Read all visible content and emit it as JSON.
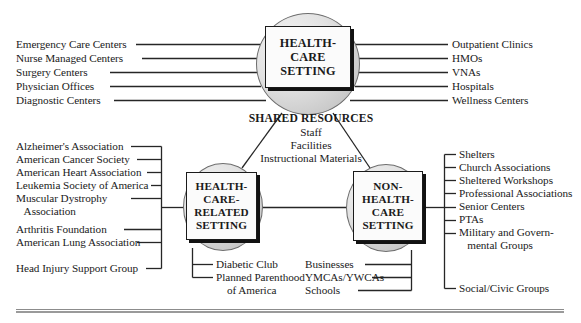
{
  "diagram": {
    "nodes": {
      "health_care_setting": "HEALTH-\nCARE\nSETTING",
      "health_care_related_setting": "HEALTH-\nCARE-\nRELATED\nSETTING",
      "non_health_care_setting": "NON-\nHEALTH-\nCARE\nSETTING"
    },
    "shared_resources": {
      "title": "SHARED RESOURCES",
      "items": [
        "Staff",
        "Facilities",
        "Instructional Materials"
      ]
    },
    "health_care_left": [
      "Emergency Care Centers",
      "Nurse Managed Centers",
      "Surgery Centers",
      "Physician Offices",
      "Diagnostic Centers"
    ],
    "health_care_right": [
      "Outpatient Clinics",
      "HMOs",
      "VNAs",
      "Hospitals",
      "Wellness Centers"
    ],
    "related_left": [
      "Alzheimer's Association",
      "American Cancer Society",
      "American Heart Association",
      "Leukemia Society of America",
      "Muscular Dystrophy",
      "   Association",
      "Arthritis Foundation",
      "American Lung Association",
      "Head Injury Support Group"
    ],
    "related_bottom": [
      "Diabetic Club",
      "Planned Parenthood",
      "    of America"
    ],
    "non_health_bottom": [
      "Businesses",
      "YMCAs/YWCAs",
      "Schools"
    ],
    "non_health_right": [
      "Shelters",
      "Church Associations",
      "Sheltered Workshops",
      "Professional Associations",
      "Senior Centers",
      "PTAs",
      "Military and Govern-",
      "   mental Groups",
      "Social/Civic Groups"
    ]
  }
}
